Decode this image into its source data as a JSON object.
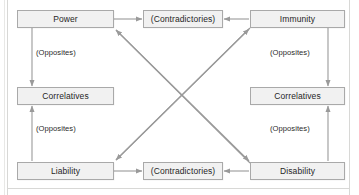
{
  "diagram": {
    "type": "relationship-square",
    "colors": {
      "node_fill": "#f1f1f1",
      "node_border": "#a9a9a9",
      "arrow": "#9a9a9a",
      "text": "#262626",
      "frame": "#d8d8d6",
      "background": "#ffffff"
    },
    "nodes": [
      {
        "id": "power",
        "label": "Power",
        "x": 17,
        "y": 10,
        "w": 97,
        "h": 18
      },
      {
        "id": "contradictories-top",
        "label": "(Contradictories)",
        "x": 143,
        "y": 10,
        "w": 80,
        "h": 18
      },
      {
        "id": "immunity",
        "label": "Immunity",
        "x": 250,
        "y": 10,
        "w": 95,
        "h": 18
      },
      {
        "id": "correlatives-left",
        "label": "Correlatives",
        "x": 17,
        "y": 87,
        "w": 97,
        "h": 18
      },
      {
        "id": "correlatives-right",
        "label": "Correlatives",
        "x": 250,
        "y": 87,
        "w": 95,
        "h": 18
      },
      {
        "id": "liability",
        "label": "Liability",
        "x": 17,
        "y": 162,
        "w": 97,
        "h": 18
      },
      {
        "id": "contradictories-bottom",
        "label": "(Contradictories)",
        "x": 143,
        "y": 162,
        "w": 80,
        "h": 18
      },
      {
        "id": "disability",
        "label": "Disability",
        "x": 250,
        "y": 162,
        "w": 95,
        "h": 18
      }
    ],
    "edge_labels": [
      {
        "id": "opposites-top-left",
        "label": "(Opposites)",
        "x": 36,
        "y": 48
      },
      {
        "id": "opposites-bottom-left",
        "label": "(Opposites)",
        "x": 36,
        "y": 124
      },
      {
        "id": "opposites-top-right",
        "label": "(Opposites)",
        "x": 270,
        "y": 48
      },
      {
        "id": "opposites-bottom-right",
        "label": "(Opposites)",
        "x": 270,
        "y": 124
      }
    ],
    "edges": [
      {
        "id": "power-to-contradictories",
        "from": "power",
        "to": "contradictories-top",
        "kind": "horizontal",
        "relation": "(Contradictories)"
      },
      {
        "id": "immunity-to-contradictories",
        "from": "immunity",
        "to": "contradictories-top",
        "kind": "horizontal",
        "relation": "(Contradictories)"
      },
      {
        "id": "liability-to-contradictories",
        "from": "liability",
        "to": "contradictories-bottom",
        "kind": "horizontal",
        "relation": "(Contradictories)"
      },
      {
        "id": "disability-to-contradictories",
        "from": "disability",
        "to": "contradictories-bottom",
        "kind": "horizontal",
        "relation": "(Contradictories)"
      },
      {
        "id": "power-to-correlatives-left",
        "from": "power",
        "to": "correlatives-left",
        "kind": "vertical",
        "relation": "(Opposites)"
      },
      {
        "id": "liability-to-correlatives-left",
        "from": "liability",
        "to": "correlatives-left",
        "kind": "vertical",
        "relation": "(Opposites)"
      },
      {
        "id": "immunity-to-correlatives-right",
        "from": "immunity",
        "to": "correlatives-right",
        "kind": "vertical",
        "relation": "(Opposites)"
      },
      {
        "id": "disability-to-correlatives-right",
        "from": "disability",
        "to": "correlatives-right",
        "kind": "vertical",
        "relation": "(Opposites)"
      },
      {
        "id": "power-disability-diagonal",
        "from": "disability",
        "to": "power",
        "kind": "diagonal",
        "relation": ""
      },
      {
        "id": "immunity-liability-diagonal",
        "from": "immunity",
        "to": "liability",
        "kind": "diagonal",
        "relation": ""
      }
    ]
  }
}
